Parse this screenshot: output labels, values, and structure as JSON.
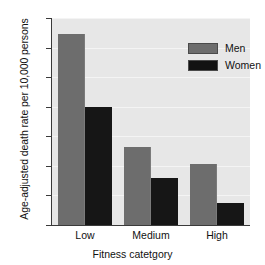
{
  "chart_data": {
    "type": "bar",
    "title": "",
    "xlabel": "Fitness catetgory",
    "ylabel": "Age-adjusted death rate per 10,000 persons",
    "categories": [
      "Low",
      "Medium",
      "High"
    ],
    "series": [
      {
        "name": "Men",
        "color": "#6d6d6d",
        "values": [
          64.5,
          26.5,
          20.5
        ]
      },
      {
        "name": "Women",
        "color": "#161616",
        "values": [
          40.0,
          16.0,
          7.5
        ]
      }
    ],
    "ylim": [
      0,
      70
    ],
    "ytick_values": [
      0,
      10,
      20,
      30,
      40,
      50,
      60,
      70
    ],
    "ytick_labels": [
      "0",
      "10",
      "20",
      "30",
      "40",
      "50",
      "60",
      "70"
    ],
    "grid": "horizontal",
    "grid_color": "#f4f4f4",
    "plot_background": "#e7e7e7",
    "legend_position": "top-right-inside"
  }
}
